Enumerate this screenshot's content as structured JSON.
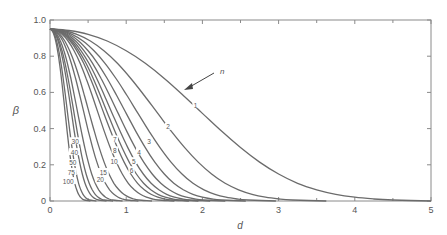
{
  "chart_data": {
    "type": "line",
    "title": "",
    "xlabel": "d",
    "ylabel": "β",
    "xlim": [
      0,
      5
    ],
    "ylim": [
      0,
      1.0
    ],
    "x_ticks": [
      "0",
      "1",
      "2",
      "3",
      "4",
      "5"
    ],
    "y_ticks": [
      "0",
      "0.2",
      "0.4",
      "0.6",
      "0.8",
      "1.0"
    ],
    "grid": false,
    "legend": "none (curves labeled inline by n)",
    "annotation": {
      "text": "n",
      "arrow_to_curve": "1"
    },
    "curve_note": "Operating characteristic curves; each series gives beta vs d for sample size n. Values sampled at d = x / sqrt(n) using the shared x grid.",
    "shared_x_grid": [
      0,
      0.25,
      0.5,
      0.75,
      1.0,
      1.25,
      1.5,
      1.75,
      2.0,
      2.25,
      2.5,
      2.75,
      3.0,
      3.25,
      3.5,
      3.75,
      4.0,
      4.25,
      4.5
    ],
    "shared_beta": [
      0.95,
      0.942,
      0.921,
      0.884,
      0.83,
      0.761,
      0.677,
      0.583,
      0.484,
      0.386,
      0.295,
      0.215,
      0.149,
      0.098,
      0.062,
      0.037,
      0.021,
      0.011,
      0.0055
    ],
    "series": [
      {
        "name": "1",
        "n": 1,
        "label_pos": [
          1.91,
          0.53
        ]
      },
      {
        "name": "2",
        "n": 2,
        "label_pos": [
          1.55,
          0.41
        ]
      },
      {
        "name": "3",
        "n": 3,
        "label_pos": [
          1.3,
          0.33
        ]
      },
      {
        "name": "4",
        "n": 4,
        "label_pos": [
          1.17,
          0.27
        ]
      },
      {
        "name": "5",
        "n": 5,
        "label_pos": [
          1.1,
          0.22
        ]
      },
      {
        "name": "6",
        "n": 6,
        "label_pos": [
          1.07,
          0.17
        ]
      },
      {
        "name": "7",
        "n": 7,
        "label_pos": [
          0.85,
          0.34
        ]
      },
      {
        "name": "8",
        "n": 8,
        "label_pos": [
          0.85,
          0.28
        ]
      },
      {
        "name": "10",
        "n": 10,
        "label_pos": [
          0.84,
          0.22
        ]
      },
      {
        "name": "15",
        "n": 15,
        "label_pos": [
          0.7,
          0.16
        ]
      },
      {
        "name": "20",
        "n": 20,
        "label_pos": [
          0.66,
          0.12
        ]
      },
      {
        "name": "30",
        "n": 30,
        "label_pos": [
          0.33,
          0.33
        ]
      },
      {
        "name": "40",
        "n": 40,
        "label_pos": [
          0.32,
          0.27
        ]
      },
      {
        "name": "50",
        "n": 50,
        "label_pos": [
          0.3,
          0.21
        ]
      },
      {
        "name": "75",
        "n": 75,
        "label_pos": [
          0.28,
          0.16
        ]
      },
      {
        "name": "100",
        "n": 100,
        "label_pos": [
          0.24,
          0.11
        ]
      }
    ]
  },
  "colors": {
    "curve": "#6b6b6b",
    "axis": "#8a8a8a",
    "text": "#555555"
  }
}
